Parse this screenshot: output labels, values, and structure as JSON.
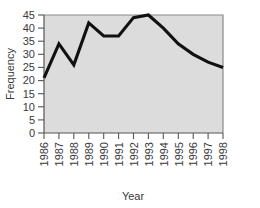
{
  "chart_data": {
    "type": "line",
    "title": "",
    "xlabel": "Year",
    "ylabel": "Frequency",
    "categories": [
      "1986",
      "1987",
      "1988",
      "1989",
      "1990",
      "1991",
      "1992",
      "1993",
      "1994",
      "1995",
      "1996",
      "1997",
      "1998"
    ],
    "x": [
      1986,
      1987,
      1988,
      1989,
      1990,
      1991,
      1992,
      1993,
      1994,
      1995,
      1996,
      1997,
      1998
    ],
    "values": [
      21,
      34,
      26,
      42,
      37,
      37,
      44,
      45,
      40,
      34,
      30,
      27,
      25
    ],
    "series": [
      {
        "name": "Frequency",
        "values": [
          21,
          34,
          26,
          42,
          37,
          37,
          44,
          45,
          40,
          34,
          30,
          27,
          25
        ]
      }
    ],
    "xlim": [
      1986,
      1998
    ],
    "ylim": [
      0,
      45
    ],
    "yticks": [
      0,
      5,
      10,
      15,
      20,
      25,
      30,
      35,
      40,
      45
    ],
    "ytick_labels": [
      "0",
      "5",
      "10",
      "15",
      "20",
      "25",
      "30",
      "35",
      "40",
      "45"
    ],
    "xtick_labels": [
      "1986",
      "1987",
      "1988",
      "1989",
      "1990",
      "1991",
      "1992",
      "1993",
      "1994",
      "1995",
      "1996",
      "1997",
      "1998"
    ],
    "grid": false,
    "legend": "none",
    "plot_background_color": "#dcdcdc",
    "line_color": "#111111",
    "axis_color": "#555555",
    "text_color": "#3a3a3a"
  }
}
